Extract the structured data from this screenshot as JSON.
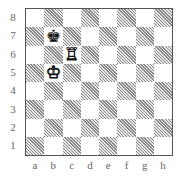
{
  "board": {
    "ranks": [
      "8",
      "7",
      "6",
      "5",
      "4",
      "3",
      "2",
      "1"
    ],
    "files": [
      "a",
      "b",
      "c",
      "d",
      "e",
      "f",
      "g",
      "h"
    ],
    "colors": {
      "light": "#ffffff",
      "dark": "#a0a0a0 (hatched)",
      "border": "#555555",
      "labels": "#666666"
    },
    "pieces": [
      {
        "square": "b7",
        "piece": "king",
        "color": "black",
        "glyph": "♚"
      },
      {
        "square": "c6",
        "piece": "rook",
        "color": "white",
        "glyph": "♖"
      },
      {
        "square": "b5",
        "piece": "king",
        "color": "white",
        "glyph": "♔"
      }
    ]
  }
}
